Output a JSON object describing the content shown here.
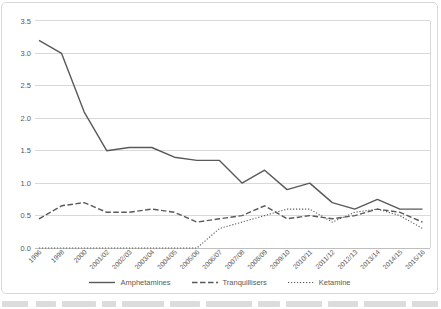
{
  "chart_data": {
    "type": "line",
    "title": "",
    "xlabel": "",
    "ylabel": "",
    "categories": [
      "1996",
      "1998",
      "2000",
      "2001/02",
      "2002/03",
      "2003/04",
      "2004/05",
      "2005/06",
      "2006/07",
      "2007/08",
      "2008/09",
      "2009/10",
      "2010/11",
      "2011/12",
      "2012/13",
      "2013/14",
      "2014/15",
      "2015/16"
    ],
    "series": [
      {
        "name": "Amphetamines",
        "line_style": "solid",
        "color": "#595959",
        "values": [
          3.2,
          3.0,
          2.1,
          1.5,
          1.55,
          1.55,
          1.4,
          1.35,
          1.35,
          1.0,
          1.2,
          0.9,
          1.0,
          0.7,
          0.6,
          0.75,
          0.6,
          0.6
        ]
      },
      {
        "name": "Tranquillisers",
        "line_style": "dashed",
        "color": "#595959",
        "values": [
          0.45,
          0.65,
          0.7,
          0.55,
          0.55,
          0.6,
          0.55,
          0.4,
          0.45,
          0.5,
          0.65,
          0.45,
          0.5,
          0.45,
          0.5,
          0.6,
          0.55,
          0.4
        ]
      },
      {
        "name": "Ketamine",
        "line_style": "dotted",
        "color": "#595959",
        "values": [
          0.0,
          0.0,
          0.0,
          0.0,
          0.0,
          0.0,
          0.0,
          0.0,
          0.3,
          0.4,
          0.5,
          0.6,
          0.6,
          0.4,
          0.55,
          0.6,
          0.5,
          0.3
        ]
      }
    ],
    "ylim": [
      0,
      3.5
    ],
    "y_ticks": [
      "0.0",
      "0.5",
      "1.0",
      "1.5",
      "2.0",
      "2.5",
      "3.0",
      "3.5"
    ],
    "grid": "horizontal",
    "legend_position": "bottom"
  },
  "colors": {
    "grid": "#d9d9d9",
    "axis_line": "#bfbfbf",
    "tick_text": "#595959",
    "card_border": "#d9d9d9",
    "background": "#ffffff"
  }
}
